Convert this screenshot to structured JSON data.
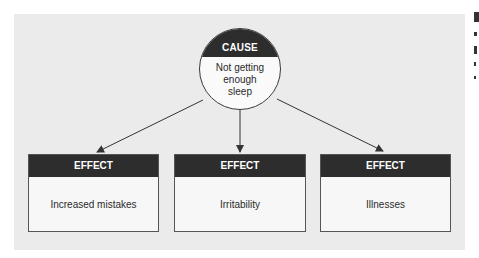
{
  "diagram": {
    "cause": {
      "label": "CAUSE",
      "text_lines": [
        "Not getting",
        "enough",
        "sleep"
      ]
    },
    "effects": [
      {
        "label": "EFFECT",
        "text": "Increased mistakes"
      },
      {
        "label": "EFFECT",
        "text": "Irritability"
      },
      {
        "label": "EFFECT",
        "text": "Illnesses"
      }
    ],
    "colors": {
      "panel_bg": "#ebebeb",
      "header_bg": "#2d2d2d",
      "header_text": "#ffffff",
      "body_bg": "#f7f7f7",
      "arrow": "#333333"
    }
  }
}
